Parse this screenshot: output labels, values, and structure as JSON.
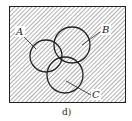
{
  "diagram": {
    "type": "venn",
    "caption": "d)",
    "sets": [
      {
        "name": "A",
        "label": "A"
      },
      {
        "name": "B",
        "label": "B"
      },
      {
        "name": "C",
        "label": "C"
      }
    ],
    "shaded_region": "complement of A∩B∩C (everything hatched except triple intersection)",
    "colors": {
      "line": "#222222",
      "hatch": "#555555",
      "background": "#ffffff"
    }
  }
}
